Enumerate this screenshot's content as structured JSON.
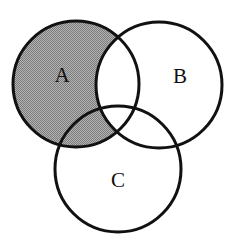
{
  "figure": {
    "width": 239,
    "height": 251,
    "background_color": "#ffffff"
  },
  "style": {
    "stroke_color": "#111111",
    "stroke_width": 3,
    "shade_color": "#999999",
    "shade_pattern": "halftone-dither",
    "label_color": "#101010",
    "unshaded_fill": "#ffffff"
  },
  "sets": [
    {
      "id": "A",
      "label": "A",
      "cx": 76,
      "cy": 84,
      "r": 63,
      "label_x": 62,
      "label_y": 77,
      "shaded": true
    },
    {
      "id": "B",
      "label": "B",
      "cx": 159,
      "cy": 85,
      "r": 63,
      "label_x": 180,
      "label_y": 78,
      "shaded": false
    },
    {
      "id": "C",
      "label": "C",
      "cx": 118,
      "cy": 169,
      "r": 63,
      "label_x": 118,
      "label_y": 182,
      "shaded": false
    }
  ],
  "regions": [
    {
      "id": "A-only",
      "expression": "A \\ (B ∪ C)",
      "shaded": true
    },
    {
      "id": "A-and-C-only",
      "expression": "(A ∩ C) \\ B",
      "shaded": true
    },
    {
      "id": "A-and-B-only",
      "expression": "(A ∩ B) \\ C",
      "shaded": false
    },
    {
      "id": "A-and-B-and-C",
      "expression": "A ∩ B ∩ C",
      "shaded": false
    },
    {
      "id": "B-only",
      "expression": "B \\ (A ∪ C)",
      "shaded": false
    },
    {
      "id": "B-and-C-only",
      "expression": "(B ∩ C) \\ A",
      "shaded": false
    },
    {
      "id": "C-only",
      "expression": "C \\ (A ∪ B)",
      "shaded": false
    },
    {
      "id": "outside",
      "expression": "U \\ (A ∪ B ∪ C)",
      "shaded": false
    }
  ],
  "shaded_region": {
    "expression": "A \\ B",
    "description": "Circle A excluding its overlap with circle B"
  }
}
